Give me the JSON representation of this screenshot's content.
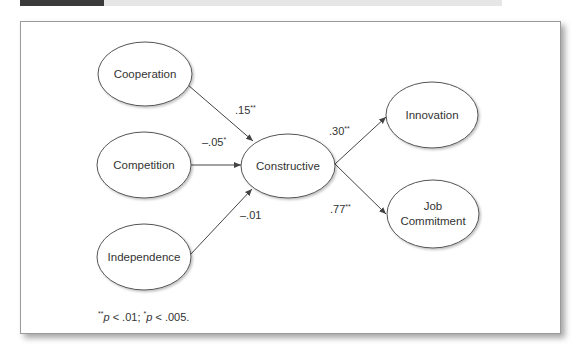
{
  "header": {
    "dark_box_color": "#3a3a3a",
    "light_bar_color": "#e6e6e6"
  },
  "diagram": {
    "nodes": [
      {
        "id": "cooperation",
        "label": "Cooperation"
      },
      {
        "id": "competition",
        "label": "Competition"
      },
      {
        "id": "independence",
        "label": "Independence"
      },
      {
        "id": "constructive",
        "label": "Constructive"
      },
      {
        "id": "innovation",
        "label": "Innovation"
      },
      {
        "id": "job_commitment",
        "label_line1": "Job",
        "label_line2": "Commitment"
      }
    ],
    "edges": [
      {
        "from": "cooperation",
        "to": "constructive",
        "coef": ".15",
        "sig": "**"
      },
      {
        "from": "competition",
        "to": "constructive",
        "coef": "–.05",
        "sig": "*"
      },
      {
        "from": "independence",
        "to": "constructive",
        "coef": "–.01",
        "sig": ""
      },
      {
        "from": "constructive",
        "to": "innovation",
        "coef": ".30",
        "sig": "**"
      },
      {
        "from": "constructive",
        "to": "job_commitment",
        "coef": ".77",
        "sig": "**"
      }
    ]
  },
  "footnote": {
    "sig1_mark": "**",
    "sig1_p": "p",
    "sig1_text": " < .01; ",
    "sig2_mark": "*",
    "sig2_p": "p",
    "sig2_text": " < .005."
  }
}
